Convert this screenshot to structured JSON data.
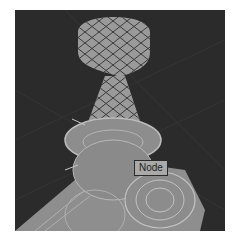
{
  "viewport": {
    "background": "#2b2b2b",
    "model_color": "#9a9a9a",
    "selected_part": "head",
    "selection_pattern": "crosshatch"
  },
  "tooltip": {
    "label": "Node"
  }
}
